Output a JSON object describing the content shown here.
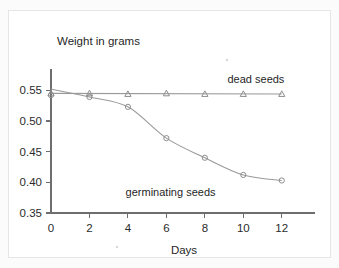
{
  "figure": {
    "background_color": "#fbfbfb",
    "card_color": "#ffffff",
    "card_border_color": "#e6e6e6",
    "axis_color": "#6e6e6e",
    "series_color": "#9a9a9a"
  },
  "chart_data": {
    "type": "line",
    "title": "",
    "xlabel": "Days",
    "ylabel": "Weight in grams",
    "xlim": [
      0,
      13
    ],
    "ylim": [
      0.35,
      0.57
    ],
    "xticks": [
      0,
      2,
      4,
      6,
      8,
      10,
      12
    ],
    "xtick_labels": [
      "0",
      "2",
      "4",
      "6",
      "8",
      "10",
      "12"
    ],
    "yticks": [
      0.35,
      0.4,
      0.45,
      0.5,
      0.55
    ],
    "ytick_labels": [
      "0.35",
      "0.40",
      "0.45",
      "0.50",
      "0.55"
    ],
    "grid": false,
    "legend_position": "inline-annotations",
    "x": [
      0,
      2,
      4,
      6,
      8,
      10,
      12
    ],
    "series": [
      {
        "name": "dead seeds",
        "marker": "triangle",
        "values": [
          0.545,
          0.545,
          0.544,
          0.545,
          0.544,
          0.544,
          0.544
        ],
        "annotation": "dead seeds",
        "annotation_x": 11.2,
        "annotation_y": 0.5625
      },
      {
        "name": "germinating seeds",
        "marker": "circle",
        "values": [
          0.542,
          0.539,
          0.523,
          0.472,
          0.44,
          0.412,
          0.403
        ],
        "annotation": "germinating seeds",
        "annotation_x": 9.6,
        "annotation_y": 0.3775
      }
    ],
    "curve_start": {
      "x": 0,
      "y": 0.552,
      "note": "germinating curve begins slightly above first marker at the axis"
    }
  }
}
